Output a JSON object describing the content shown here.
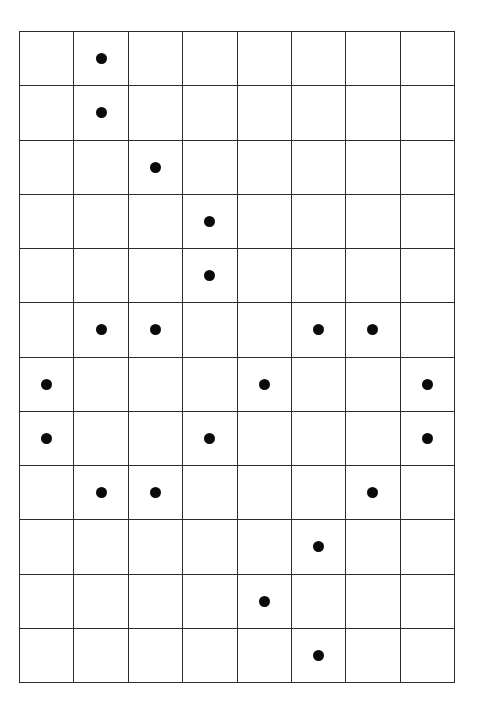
{
  "figure": {
    "rows": 12,
    "columns": 8,
    "cell_width_px": 54.5,
    "cell_height_px": 54.3,
    "dot_diameter_px": 11,
    "grid_line_color": "#2b2b2b",
    "dot_color": "#0a0a0a",
    "background_color": "#ffffff",
    "total_dots": 24
  },
  "chart_data": {
    "type": "heatmap",
    "xlabel": "",
    "ylabel": "",
    "grid": true,
    "legend": "none",
    "categories": [
      "1",
      "2",
      "3",
      "4",
      "5",
      "6",
      "7",
      "8"
    ],
    "row_labels": [
      "1",
      "2",
      "3",
      "4",
      "5",
      "6",
      "7",
      "8",
      "9",
      "10",
      "11",
      "12"
    ],
    "marked_cells": [
      {
        "row": 1,
        "columns": [
          2
        ]
      },
      {
        "row": 2,
        "columns": [
          2
        ]
      },
      {
        "row": 3,
        "columns": [
          3
        ]
      },
      {
        "row": 4,
        "columns": [
          4
        ]
      },
      {
        "row": 5,
        "columns": [
          4
        ]
      },
      {
        "row": 6,
        "columns": [
          2,
          3,
          6,
          7
        ]
      },
      {
        "row": 7,
        "columns": [
          1,
          5,
          8
        ]
      },
      {
        "row": 8,
        "columns": [
          1,
          4,
          8
        ]
      },
      {
        "row": 9,
        "columns": [
          2,
          3,
          7
        ]
      },
      {
        "row": 10,
        "columns": [
          6
        ]
      },
      {
        "row": 11,
        "columns": [
          5
        ]
      },
      {
        "row": 12,
        "columns": [
          6
        ]
      }
    ],
    "matrix": [
      [
        0,
        1,
        0,
        0,
        0,
        0,
        0,
        0
      ],
      [
        0,
        1,
        0,
        0,
        0,
        0,
        0,
        0
      ],
      [
        0,
        0,
        1,
        0,
        0,
        0,
        0,
        0
      ],
      [
        0,
        0,
        0,
        1,
        0,
        0,
        0,
        0
      ],
      [
        0,
        0,
        0,
        1,
        0,
        0,
        0,
        0
      ],
      [
        0,
        1,
        1,
        0,
        0,
        1,
        1,
        0
      ],
      [
        1,
        0,
        0,
        0,
        1,
        0,
        0,
        1
      ],
      [
        1,
        0,
        0,
        1,
        0,
        0,
        0,
        1
      ],
      [
        0,
        1,
        1,
        0,
        0,
        0,
        1,
        0
      ],
      [
        0,
        0,
        0,
        0,
        0,
        1,
        0,
        0
      ],
      [
        0,
        0,
        0,
        0,
        1,
        0,
        0,
        0
      ],
      [
        0,
        0,
        0,
        0,
        0,
        1,
        0,
        0
      ]
    ],
    "row_counts": [
      1,
      1,
      1,
      1,
      1,
      4,
      3,
      3,
      3,
      1,
      1,
      1
    ],
    "column_counts": [
      2,
      4,
      3,
      3,
      2,
      4,
      3,
      2
    ]
  }
}
